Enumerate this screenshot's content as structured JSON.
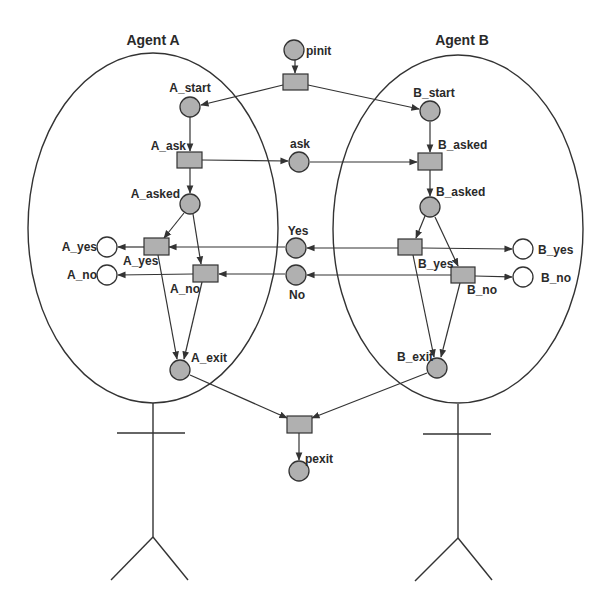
{
  "diagram": {
    "type": "petri-net",
    "colors": {
      "marked_place": "#b0b0b0",
      "empty_place": "#ffffff",
      "transition": "#b0b0b0",
      "stroke": "#333333"
    },
    "agents": [
      {
        "id": "agentA",
        "title": "Agent A"
      },
      {
        "id": "agentB",
        "title": "Agent B"
      }
    ],
    "places": [
      {
        "id": "pinit",
        "label": "pinit",
        "marked": true
      },
      {
        "id": "A_start",
        "label": "A_start",
        "marked": true
      },
      {
        "id": "A_asked",
        "label": "A_asked",
        "marked": true
      },
      {
        "id": "A_yes_p",
        "label": "A_yes",
        "marked": false
      },
      {
        "id": "A_no_p",
        "label": "A_no",
        "marked": false
      },
      {
        "id": "A_exit",
        "label": "A_exit",
        "marked": true
      },
      {
        "id": "ask",
        "label": "ask",
        "marked": true
      },
      {
        "id": "Yes",
        "label": "Yes",
        "marked": true
      },
      {
        "id": "No",
        "label": "No",
        "marked": true
      },
      {
        "id": "B_start",
        "label": "B_start",
        "marked": true
      },
      {
        "id": "B_asked_p",
        "label": "B_asked",
        "marked": true
      },
      {
        "id": "B_yes_p",
        "label": "B_yes",
        "marked": false
      },
      {
        "id": "B_no_p",
        "label": "B_no",
        "marked": false
      },
      {
        "id": "B_exit",
        "label": "B_exit",
        "marked": true
      },
      {
        "id": "pexit",
        "label": "pexit",
        "marked": true
      }
    ],
    "transitions": [
      {
        "id": "t_init",
        "label": ""
      },
      {
        "id": "A_ask",
        "label": "A_ask"
      },
      {
        "id": "A_yes_t",
        "label": "A_yes"
      },
      {
        "id": "A_no_t",
        "label": "A_no"
      },
      {
        "id": "B_asked_t",
        "label": "B_asked"
      },
      {
        "id": "B_yes_t",
        "label": "B_yes"
      },
      {
        "id": "B_no_t",
        "label": "B_no"
      },
      {
        "id": "t_exit",
        "label": ""
      }
    ],
    "arcs": [
      {
        "from": "pinit",
        "to": "t_init"
      },
      {
        "from": "t_init",
        "to": "A_start"
      },
      {
        "from": "t_init",
        "to": "B_start"
      },
      {
        "from": "A_start",
        "to": "A_ask"
      },
      {
        "from": "A_ask",
        "to": "A_asked"
      },
      {
        "from": "A_ask",
        "to": "ask"
      },
      {
        "from": "ask",
        "to": "B_asked_t"
      },
      {
        "from": "B_start",
        "to": "B_asked_t"
      },
      {
        "from": "B_asked_t",
        "to": "B_asked_p"
      },
      {
        "from": "A_asked",
        "to": "A_yes_t"
      },
      {
        "from": "A_asked",
        "to": "A_no_t"
      },
      {
        "from": "Yes",
        "to": "A_yes_t"
      },
      {
        "from": "No",
        "to": "A_no_t"
      },
      {
        "from": "A_yes_t",
        "to": "A_yes_p"
      },
      {
        "from": "A_no_t",
        "to": "A_no_p"
      },
      {
        "from": "A_yes_t",
        "to": "A_exit"
      },
      {
        "from": "A_no_t",
        "to": "A_exit"
      },
      {
        "from": "B_asked_p",
        "to": "B_yes_t"
      },
      {
        "from": "B_asked_p",
        "to": "B_no_t"
      },
      {
        "from": "B_yes_t",
        "to": "Yes"
      },
      {
        "from": "B_no_t",
        "to": "No"
      },
      {
        "from": "B_yes_t",
        "to": "B_yes_p"
      },
      {
        "from": "B_no_t",
        "to": "B_no_p"
      },
      {
        "from": "B_yes_t",
        "to": "B_exit"
      },
      {
        "from": "B_no_t",
        "to": "B_exit"
      },
      {
        "from": "A_exit",
        "to": "t_exit"
      },
      {
        "from": "B_exit",
        "to": "t_exit"
      },
      {
        "from": "t_exit",
        "to": "pexit"
      }
    ]
  }
}
